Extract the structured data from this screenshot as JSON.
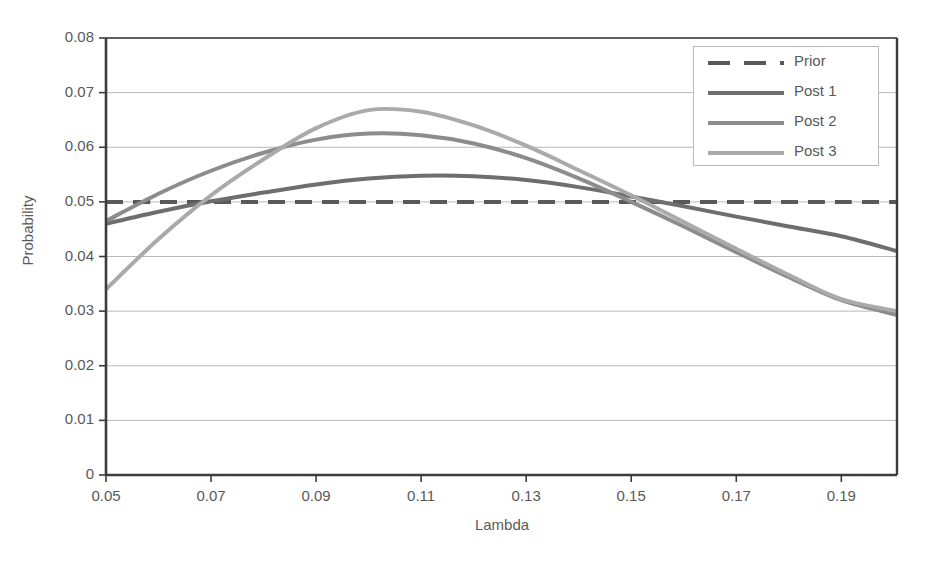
{
  "chart_data": {
    "type": "line",
    "title": "",
    "xlabel": "Lambda",
    "ylabel": "Probability",
    "xlim": [
      0.05,
      0.2006
    ],
    "ylim": [
      0,
      0.08
    ],
    "xticks": [
      "0.05",
      "0.07",
      "0.09",
      "0.11",
      "0.13",
      "0.15",
      "0.17",
      "0.19"
    ],
    "xtick_values": [
      0.05,
      0.07,
      0.09,
      0.11,
      0.13,
      0.15,
      0.17,
      0.19
    ],
    "yticks": [
      "0",
      "0.01",
      "0.02",
      "0.03",
      "0.04",
      "0.05",
      "0.06",
      "0.07",
      "0.08"
    ],
    "ytick_values": [
      0,
      0.01,
      0.02,
      0.03,
      0.04,
      0.05,
      0.06,
      0.07,
      0.08
    ],
    "grid": "horizontal",
    "legend_position": "top-right",
    "x": [
      0.05,
      0.06,
      0.07,
      0.08,
      0.09,
      0.1,
      0.11,
      0.12,
      0.13,
      0.14,
      0.15,
      0.16,
      0.17,
      0.18,
      0.19,
      0.2006
    ],
    "series": [
      {
        "name": "Prior",
        "style": "dashed",
        "color": "#595959",
        "width": 4,
        "values": [
          0.05,
          0.05,
          0.05,
          0.05,
          0.05,
          0.05,
          0.05,
          0.05,
          0.05,
          0.05,
          0.05,
          0.05,
          0.05,
          0.05,
          0.05,
          0.05
        ]
      },
      {
        "name": "Post 1",
        "style": "solid",
        "color": "#6e6e6e",
        "width": 4,
        "values": [
          0.046,
          0.0482,
          0.0501,
          0.0517,
          0.0532,
          0.0543,
          0.0548,
          0.0547,
          0.054,
          0.0527,
          0.051,
          0.0492,
          0.0473,
          0.0455,
          0.0437,
          0.041
        ]
      },
      {
        "name": "Post 2",
        "style": "solid",
        "color": "#8c8c8c",
        "width": 4,
        "values": [
          0.0465,
          0.0515,
          0.0557,
          0.059,
          0.0614,
          0.0625,
          0.0622,
          0.0607,
          0.058,
          0.0543,
          0.05,
          0.0455,
          0.0408,
          0.0362,
          0.032,
          0.0293
        ]
      },
      {
        "name": "Post 3",
        "style": "solid",
        "color": "#aaaaaa",
        "width": 4,
        "values": [
          0.034,
          0.0432,
          0.0512,
          0.0578,
          0.0635,
          0.0668,
          0.0665,
          0.064,
          0.0603,
          0.0558,
          0.0512,
          0.0463,
          0.0414,
          0.0366,
          0.0322,
          0.03
        ]
      }
    ]
  },
  "legend": {
    "items": [
      {
        "label": "Prior"
      },
      {
        "label": "Post 1"
      },
      {
        "label": "Post 2"
      },
      {
        "label": "Post 3"
      }
    ]
  },
  "axis": {
    "x_title": "Lambda",
    "y_title": "Probability"
  },
  "colors": {
    "prior": "#595959",
    "post1": "#6e6e6e",
    "post2": "#8c8c8c",
    "post3": "#aaaaaa",
    "axis": "#3c3c3c",
    "grid": "#b9b9b9",
    "text": "#595959",
    "background": "#ffffff"
  }
}
